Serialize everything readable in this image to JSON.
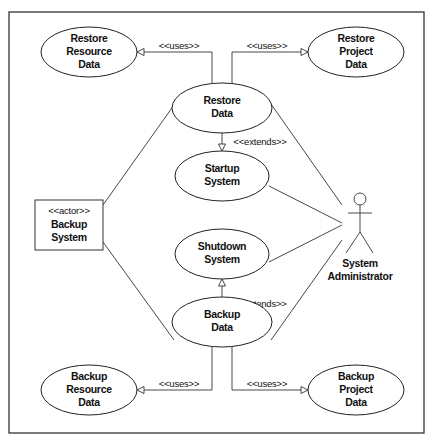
{
  "diagram": {
    "type": "uml-use-case",
    "use_cases": {
      "restore_resource_data": [
        "Restore",
        "Resource",
        "Data"
      ],
      "restore_project_data": [
        "Restore",
        "Project",
        "Data"
      ],
      "restore_data": [
        "Restore",
        "Data"
      ],
      "startup_system": [
        "Startup",
        "System"
      ],
      "shutdown_system": [
        "Shutdown",
        "System"
      ],
      "backup_data": [
        "Backup",
        "Data"
      ],
      "backup_resource_data": [
        "Backup",
        "Resource",
        "Data"
      ],
      "backup_project_data": [
        "Backup",
        "Project",
        "Data"
      ]
    },
    "actors": {
      "backup_system": {
        "stereotype": "<<actor>>",
        "name": [
          "Backup",
          "System"
        ]
      },
      "system_administrator": {
        "name": [
          "System",
          "Administrator"
        ]
      }
    },
    "relationships": {
      "uses_label": "<<uses>>",
      "extends_label": "<<extends>>",
      "list": [
        {
          "from": "Restore Data",
          "to": "Restore Resource Data",
          "type": "<<uses>>"
        },
        {
          "from": "Restore Data",
          "to": "Restore Project Data",
          "type": "<<uses>>"
        },
        {
          "from": "Restore Data",
          "to": "Startup System",
          "type": "<<extends>>"
        },
        {
          "from": "Backup Data",
          "to": "Shutdown System",
          "type": "<<extends>>"
        },
        {
          "from": "Backup Data",
          "to": "Backup Resource Data",
          "type": "<<uses>>"
        },
        {
          "from": "Backup Data",
          "to": "Backup Project Data",
          "type": "<<uses>>"
        },
        {
          "from": "Backup System",
          "to": "Restore Data",
          "type": "association"
        },
        {
          "from": "Backup System",
          "to": "Backup Data",
          "type": "association"
        },
        {
          "from": "System Administrator",
          "to": "Restore Data",
          "type": "association"
        },
        {
          "from": "System Administrator",
          "to": "Startup System",
          "type": "association"
        },
        {
          "from": "System Administrator",
          "to": "Shutdown System",
          "type": "association"
        },
        {
          "from": "System Administrator",
          "to": "Backup Data",
          "type": "association"
        }
      ]
    }
  }
}
